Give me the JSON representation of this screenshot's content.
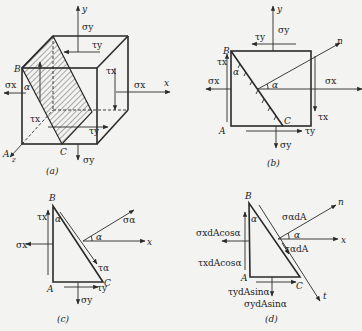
{
  "figure": {
    "panels": [
      {
        "id": "a",
        "caption": "(a)",
        "description": "3D cubic stress element with hatched inclined plane BC",
        "labels": {
          "axis_y": "y",
          "axis_x": "x",
          "axis_z": "z",
          "point_A": "A",
          "point_B": "B",
          "point_C": "C",
          "angle": "α",
          "sigma_y_top": "σy",
          "sigma_y_bottom": "σy",
          "sigma_x_left": "σx",
          "sigma_x_right": "σx",
          "tau_y_top": "τy",
          "tau_y_bottom": "τy",
          "tau_x_right": "τx",
          "tau_x_left": "τx"
        }
      },
      {
        "id": "b",
        "caption": "(b)",
        "description": "2D projection of stress element with inclined section BC and normal n",
        "labels": {
          "axis_y": "y",
          "axis_x": "x",
          "normal": "n",
          "point_A": "A",
          "point_B": "B",
          "point_C": "C",
          "angle_top": "α",
          "angle_normal": "α",
          "sigma_y_top": "σy",
          "sigma_y_bottom": "σy",
          "sigma_x_left": "σx",
          "sigma_x_right": "σx",
          "tau_y_top": "τy",
          "tau_y_bottom": "τy",
          "tau_x_left": "τx",
          "tau_x_right": "τx"
        }
      },
      {
        "id": "c",
        "caption": "(c)",
        "description": "Free-body triangle ABC with stresses",
        "labels": {
          "axis_x": "x",
          "point_A": "A",
          "point_B": "B",
          "point_C": "C",
          "angle_top": "α",
          "angle_normal": "α",
          "sigma_x": "σx",
          "sigma_y": "σy",
          "tau_x": "τx",
          "tau_y": "τy",
          "sigma_alpha": "σα",
          "tau_alpha": "τα"
        }
      },
      {
        "id": "d",
        "caption": "(d)",
        "description": "Free-body triangle ABC with forces on faces",
        "labels": {
          "axis_x": "x",
          "normal": "n",
          "tangent": "t",
          "point_A": "A",
          "point_B": "B",
          "point_C": "C",
          "angle_top": "α",
          "angle_normal": "α",
          "sigma_x_force": "σxdAcosα",
          "tau_x_force": "τxdAcosα",
          "tau_y_force": "τydAsinα",
          "sigma_y_force": "σydAsinα",
          "sigma_alpha_force": "σαdA",
          "tau_alpha_force": "ταdA"
        }
      }
    ]
  }
}
